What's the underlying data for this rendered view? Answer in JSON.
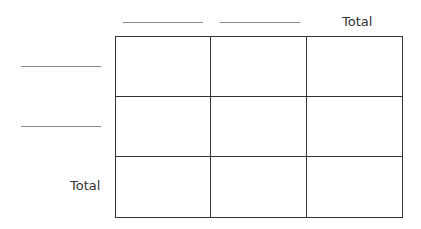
{
  "table": {
    "column_headers": [
      "",
      "",
      "Total"
    ],
    "row_headers": [
      "",
      "",
      "Total"
    ],
    "cells": [
      [
        "",
        "",
        ""
      ],
      [
        "",
        "",
        ""
      ],
      [
        "",
        "",
        ""
      ]
    ]
  }
}
